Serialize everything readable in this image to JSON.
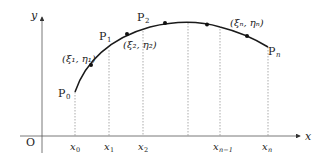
{
  "diagram": {
    "type": "curve-partition",
    "colors": {
      "curve": "#1a1a1a",
      "axis": "#555555",
      "guide": "#888888",
      "text": "#222222"
    },
    "axes": {
      "x_label": "x",
      "y_label": "y",
      "origin_label": "O"
    },
    "points": [
      {
        "label": "P",
        "sub": "0"
      },
      {
        "label": "P",
        "sub": "1"
      },
      {
        "label": "P",
        "sub": "2"
      },
      {
        "label": "P",
        "sub": "n"
      }
    ],
    "sample_points": [
      {
        "label": "(ξ₁, η₁)"
      },
      {
        "label": "(ξ₂, η₂)"
      },
      {
        "label": "(ξₙ, ηₙ)"
      }
    ],
    "x_ticks": [
      {
        "label": "x",
        "sub": "0"
      },
      {
        "label": "x",
        "sub": "1"
      },
      {
        "label": "x",
        "sub": "2"
      },
      {
        "label": "x",
        "sub": "n−1"
      },
      {
        "label": "x",
        "sub": "n"
      }
    ]
  }
}
